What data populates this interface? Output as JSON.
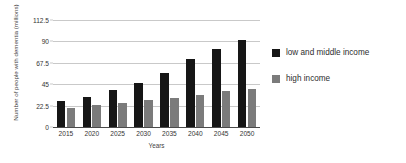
{
  "chart_data": {
    "type": "bar",
    "title": "",
    "xlabel": "Years",
    "ylabel": "Number of people with dementia (millions)",
    "categories": [
      "2015",
      "2020",
      "2025",
      "2030",
      "2035",
      "2040",
      "2045",
      "2050"
    ],
    "series": [
      {
        "name": "low and middle income",
        "color": "#161616",
        "values": [
          27,
          32,
          39,
          46,
          57,
          72,
          82,
          92
        ]
      },
      {
        "name": "high income",
        "color": "#7b7b7b",
        "values": [
          20,
          23,
          25,
          28,
          31,
          34,
          38,
          40
        ]
      }
    ],
    "ylim": [
      0,
      112.5
    ],
    "yticks": [
      "0",
      "22.5",
      "45",
      "67.5",
      "90",
      "112.5"
    ],
    "ytick_values": [
      0,
      22.5,
      45,
      67.5,
      90,
      112.5
    ],
    "grid": true,
    "legend_position": "right"
  },
  "legend": {
    "items": [
      {
        "label": "low and middle income",
        "color": "#161616"
      },
      {
        "label": "high income",
        "color": "#7b7b7b"
      }
    ]
  }
}
